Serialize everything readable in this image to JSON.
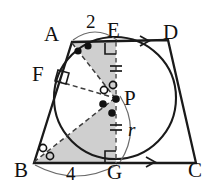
{
  "figure": {
    "type": "geometry-diagram",
    "background_color": "#ffffff",
    "stroke_color": "#1a1a1a",
    "shade_color": "#cfcfcf",
    "dash_color": "#4a4a4a"
  },
  "labels": {
    "vertex_a": "A",
    "vertex_b": "B",
    "vertex_c": "C",
    "vertex_d": "D",
    "point_e": "E",
    "point_f": "F",
    "point_g": "G",
    "point_p": "P",
    "length_ae": "2",
    "length_bg": "4",
    "radius": "r"
  },
  "geometry": {
    "points": {
      "A": [
        72,
        42
      ],
      "B": [
        34,
        163
      ],
      "C": [
        196,
        163
      ],
      "D": [
        168,
        40
      ],
      "E": [
        116,
        42
      ],
      "F": [
        56,
        80
      ],
      "G": [
        116,
        163
      ],
      "P": [
        115,
        98
      ]
    },
    "circle": {
      "cx": 115,
      "cy": 98,
      "r": 61
    },
    "shaded_triangles": [
      {
        "name": "triangle-aep",
        "vertices": [
          "A",
          "E",
          "P"
        ]
      },
      {
        "name": "triangle-bgp",
        "vertices": [
          "B",
          "G",
          "P"
        ]
      }
    ],
    "dashed_segments": [
      [
        "A",
        "P"
      ],
      [
        "F",
        "P"
      ],
      [
        "B",
        "P"
      ],
      [
        "E",
        "G"
      ]
    ],
    "right_angle_marks": [
      "E",
      "F",
      "G"
    ],
    "tick_marks": {
      "segment_ep": 2,
      "segment_pg": 2
    },
    "angle_marks": {
      "at_A": {
        "style": "filled-dot",
        "count": 2
      },
      "at_B": {
        "style": "open-circle",
        "count": 2
      },
      "at_P_upper": {
        "style": "open-circle",
        "count": 2
      },
      "at_P_lower": {
        "style": "filled-dot",
        "count": 2
      }
    },
    "parallel_arrows": [
      "ED",
      "GC"
    ],
    "dimension_arcs": [
      {
        "label": "2",
        "from": "A",
        "to": "E"
      },
      {
        "label": "4",
        "from": "B",
        "to": "G"
      },
      {
        "label": "r",
        "from": "P",
        "to": "G"
      }
    ]
  }
}
